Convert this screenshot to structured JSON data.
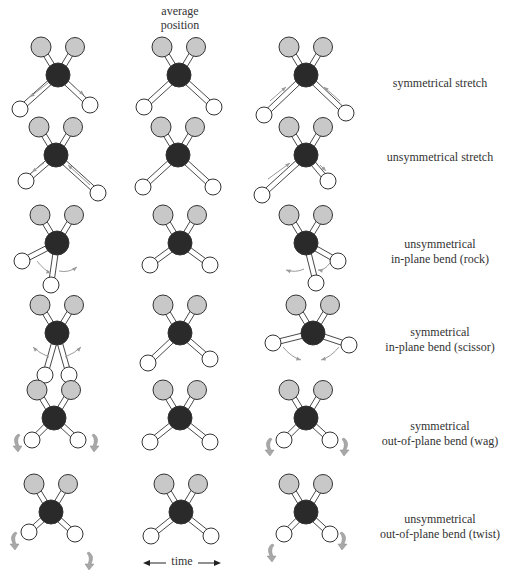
{
  "header": {
    "line1": "average",
    "line2": "position"
  },
  "time_axis": {
    "label": "time",
    "arrows": "left-right"
  },
  "colors": {
    "carbon": "#2a2a2a",
    "top_atom": "#c8c8c8",
    "bottom_atom": "#ffffff",
    "outline": "#333333",
    "motion_arrow": "#9a9a9a",
    "rotation_arrow": "#a8a8a8"
  },
  "columns": [
    "displaced-state-1",
    "average-position",
    "displaced-state-2"
  ],
  "rows": [
    {
      "name": "symmetrical-stretch",
      "line1": "symmetrical stretch",
      "line2": "",
      "cy": 75,
      "mols": [
        {
          "cx": 58,
          "bl": [
            -38,
            34
          ],
          "br": [
            32,
            30
          ],
          "arrows": "stretch-out"
        },
        {
          "cx": 179,
          "bl": [
            -35,
            32
          ],
          "br": [
            35,
            32
          ],
          "arrows": ""
        },
        {
          "cx": 306,
          "bl": [
            -42,
            40
          ],
          "br": [
            40,
            38
          ],
          "arrows": "stretch-in"
        }
      ]
    },
    {
      "name": "unsymmetrical-stretch",
      "line1": "unsymmetrical stretch",
      "line2": "",
      "cy": 155,
      "mols": [
        {
          "cx": 56,
          "bl": [
            -30,
            26
          ],
          "br": [
            42,
            38
          ],
          "arrows": "asym-1"
        },
        {
          "cx": 178,
          "bl": [
            -35,
            32
          ],
          "br": [
            35,
            32
          ],
          "arrows": ""
        },
        {
          "cx": 306,
          "bl": [
            -44,
            40
          ],
          "br": [
            22,
            26
          ],
          "arrows": "asym-2"
        }
      ]
    },
    {
      "name": "unsymmetrical-in-plane-bend-rock",
      "line1": "unsymmetrical",
      "line2": "in-plane bend (rock)",
      "cy": 243,
      "mols": [
        {
          "cx": 57,
          "bl": [
            -35,
            18
          ],
          "br": [
            -6,
            42
          ],
          "arrows": "rock-1"
        },
        {
          "cx": 180,
          "bl": [
            -30,
            22
          ],
          "br": [
            30,
            22
          ],
          "arrows": ""
        },
        {
          "cx": 306,
          "bl": [
            10,
            40
          ],
          "br": [
            32,
            18
          ],
          "arrows": "rock-2"
        }
      ]
    },
    {
      "name": "symmetrical-in-plane-bend-scissor",
      "line1": "symmetrical",
      "line2": "in-plane bend (scissor)",
      "cy": 333,
      "mols": [
        {
          "cx": 57,
          "bl": [
            -12,
            42
          ],
          "br": [
            12,
            42
          ],
          "arrows": "scissor-out"
        },
        {
          "cx": 180,
          "bl": [
            -32,
            30
          ],
          "br": [
            30,
            26
          ],
          "arrows": ""
        },
        {
          "cx": 313,
          "bl": [
            -40,
            10
          ],
          "br": [
            36,
            12
          ],
          "arrows": "scissor-in"
        }
      ]
    },
    {
      "name": "symmetrical-out-of-plane-bend-wag",
      "line1": "symmetrical",
      "line2": "out-of-plane bend (wag)",
      "cy": 418,
      "mols": [
        {
          "cx": 54,
          "bl": [
            -22,
            22
          ],
          "br": [
            24,
            22
          ],
          "arrows": "wag-1"
        },
        {
          "cx": 180,
          "bl": [
            -30,
            24
          ],
          "br": [
            30,
            24
          ],
          "arrows": ""
        },
        {
          "cx": 306,
          "bl": [
            -22,
            22
          ],
          "br": [
            24,
            22
          ],
          "arrows": "wag-2"
        }
      ]
    },
    {
      "name": "unsymmetrical-out-of-plane-bend-twist",
      "line1": "unsymmetrical",
      "line2": "out-of-plane bend (twist)",
      "cy": 512,
      "mols": [
        {
          "cx": 51,
          "bl": [
            -22,
            20
          ],
          "br": [
            24,
            22
          ],
          "arrows": "twist-1"
        },
        {
          "cx": 181,
          "bl": [
            -30,
            24
          ],
          "br": [
            30,
            24
          ],
          "arrows": ""
        },
        {
          "cx": 306,
          "bl": [
            -22,
            22
          ],
          "br": [
            24,
            22
          ],
          "arrows": "twist-2"
        }
      ]
    }
  ]
}
